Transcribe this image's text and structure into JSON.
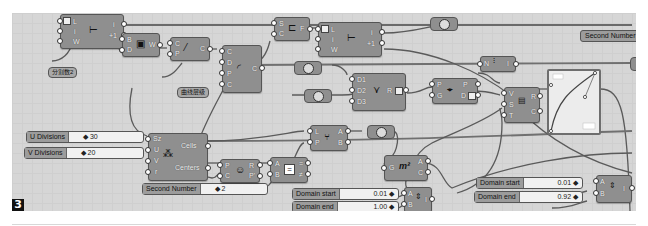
{
  "figure_label": "3",
  "components": {
    "series_1": {
      "inputs": [
        "L",
        "i",
        "W"
      ],
      "outputs": [
        "i",
        "+1"
      ]
    },
    "box": {
      "inputs": [
        "B",
        "D"
      ],
      "outputs": [
        "W"
      ]
    },
    "line": {
      "inputs": [
        "C",
        "P"
      ],
      "outputs": [
        "C"
      ]
    },
    "arc": {
      "inputs": [
        "C",
        "D",
        "P",
        "C"
      ],
      "outputs": [
        "C"
      ]
    },
    "shift": {
      "inputs": [
        "S",
        "C"
      ],
      "outputs": [
        "F"
      ]
    },
    "series_2": {
      "inputs": [
        "L",
        "i",
        "W"
      ],
      "outputs": [
        "i",
        "+1"
      ]
    },
    "merge": {
      "inputs": [
        "D1",
        "D2",
        "D3"
      ],
      "outputs": [
        "R"
      ]
    },
    "pull": {
      "inputs": [
        "P",
        "G"
      ],
      "outputs": [
        "P",
        "D"
      ]
    },
    "list_item": {
      "inputs": [
        "N"
      ],
      "outputs": [
        "I"
      ]
    },
    "remap": {
      "inputs": [
        "V",
        "S",
        "T"
      ],
      "outputs": [
        "R",
        "C"
      ]
    },
    "rect_grid": {
      "inputs": [
        "Sz",
        "U",
        "V",
        "r"
      ],
      "outputs": [
        "Cells",
        "Centers"
      ]
    },
    "pop": {
      "inputs": [
        "P",
        "C"
      ],
      "outputs": [
        "R",
        "P'"
      ]
    },
    "equals": {
      "inputs": [
        "A",
        "B"
      ],
      "outputs": [
        "=",
        "≠"
      ]
    },
    "dispatch": {
      "inputs": [
        "L",
        "P"
      ],
      "outputs": [
        "A",
        "B"
      ]
    },
    "area": {
      "inputs": [
        "G"
      ],
      "outputs": [
        "A",
        "C"
      ]
    },
    "bounds_1": {
      "inputs": [
        "A",
        "B"
      ],
      "outputs": [
        "I"
      ]
    },
    "bounds_2": {
      "inputs": [
        "A",
        "B"
      ],
      "outputs": [
        "I"
      ]
    }
  },
  "panels": {
    "divide_note": "分割数2",
    "curve_note": "曲线层级",
    "second_number_top": "Second Number"
  },
  "sliders": {
    "u_divisions": {
      "name": "U Divisions",
      "value": "30"
    },
    "v_divisions": {
      "name": "V Divisions",
      "value": "20"
    },
    "second_number": {
      "name": "Second Number",
      "value": "2"
    },
    "domain_start_1": {
      "name": "Domain start",
      "value": "0.01"
    },
    "domain_end_1": {
      "name": "Domain end",
      "value": "1.00"
    },
    "domain_start_2": {
      "name": "Domain start",
      "value": "0.01"
    },
    "domain_end_2": {
      "name": "Domain end",
      "value": "0.92"
    }
  },
  "colors": {
    "canvas": "#d6d6d6",
    "component": "#8f8f8f",
    "wire": "#555555",
    "slider_bg": "#f1f1f1"
  }
}
